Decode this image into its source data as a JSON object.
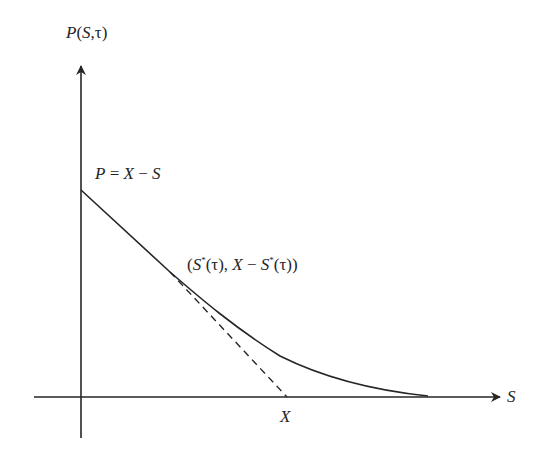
{
  "diagram": {
    "y_axis_label": "P(S,τ)",
    "x_axis_label": "S",
    "intercept_label": "P = X − S",
    "tangent_point_label": "(S*(τ), X − S*(τ))",
    "strike_label": "X",
    "colors": {
      "line": "#262626",
      "background": "#ffffff"
    },
    "geometry": {
      "origin": [
        81,
        397
      ],
      "y_axis_top": [
        81,
        64
      ],
      "x_axis_right": [
        502,
        397
      ],
      "curve_intercept": [
        81,
        190
      ],
      "tangent_point": [
        170,
        272
      ],
      "strike_point": [
        287,
        397
      ],
      "curve_end": [
        428,
        396
      ]
    }
  },
  "labels": {
    "p_of_s_tau": {
      "P": "P",
      "open": "(",
      "S": "S",
      "comma": ",",
      "tau": "τ",
      "close": ")"
    },
    "payoff": {
      "P": "P",
      "eq": " = ",
      "X": "X",
      "minus": " − ",
      "S": "S"
    },
    "tangent": {
      "open": "(",
      "S1": "S",
      "star1": "*",
      "tau1": "(τ)",
      "comma": ", ",
      "X": "X",
      "minus": " − ",
      "S2": "S",
      "star2": "*",
      "tau2": "(τ)",
      "close": ")"
    },
    "s_axis": "S",
    "strike": "X"
  }
}
